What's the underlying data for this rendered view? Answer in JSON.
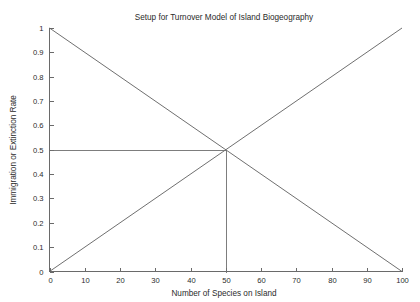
{
  "chart_data": {
    "type": "line",
    "title": "Setup for Turnover Model of Island Biogeography",
    "xlabel": "Number of Species on Island",
    "ylabel": "Immigration or Extinction Rate",
    "xlim": [
      0,
      100
    ],
    "ylim": [
      0,
      1
    ],
    "grid": false,
    "legend": null,
    "legend_position": "none",
    "xticks": [
      0,
      10,
      20,
      30,
      40,
      50,
      60,
      70,
      80,
      90,
      100
    ],
    "xticklabels": [
      "0",
      "10",
      "20",
      "30",
      "40",
      "50",
      "60",
      "70",
      "80",
      "90",
      "100"
    ],
    "yticks": [
      0,
      0.1,
      0.2,
      0.3,
      0.4,
      0.5,
      0.6,
      0.7,
      0.8,
      0.9,
      1
    ],
    "yticklabels": [
      "0",
      "0.1",
      "0.2",
      "0.3",
      "0.4",
      "0.5",
      "0.6",
      "0.7",
      "0.8",
      "0.9",
      "1"
    ],
    "series": [
      {
        "name": "Immigration Rate",
        "description": "Descending line from (0, 1) to (100, 0)",
        "x": [
          0,
          100
        ],
        "values": [
          1,
          0
        ],
        "color": "#5f5f5f"
      },
      {
        "name": "Extinction Rate",
        "description": "Ascending line from (0, 0) to (100, 1)",
        "x": [
          0,
          100
        ],
        "values": [
          0,
          1
        ],
        "color": "#5f5f5f"
      }
    ],
    "annotations": [
      {
        "name": "equilibrium-horizontal-guide",
        "description": "Horizontal guide line from y-axis to equilibrium point",
        "x": [
          0,
          50
        ],
        "y": [
          0.5,
          0.5
        ],
        "color": "#6f6f6f"
      },
      {
        "name": "equilibrium-vertical-guide",
        "description": "Vertical guide line from equilibrium point down to x-axis",
        "x": [
          50,
          50
        ],
        "y": [
          0.5,
          0
        ],
        "color": "#6f6f6f"
      }
    ],
    "equilibrium_point": {
      "x": 50,
      "y": 0.5
    }
  },
  "colors": {
    "background": "#ffffff",
    "axis": "#6a6a6a",
    "line": "#5f5f5f",
    "text": "#2b2b2b"
  }
}
